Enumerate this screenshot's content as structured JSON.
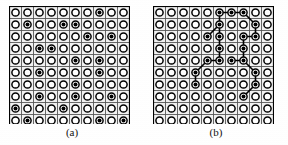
{
  "figure": {
    "type": "two-panel-lattice-diagram",
    "background_color": "#ffffff",
    "ink_color": "#000000",
    "gridline_color": "#555555",
    "cell_fill_color": "#f2f2f2",
    "grid_rows": 10,
    "grid_cols": 10,
    "cell_size_px": 12,
    "node_outer_radius_px": 3.6,
    "node_inner_radius_px": 2.0,
    "edge_width_px": 1.6
  },
  "panels": [
    {
      "id": "panel-a",
      "caption": "(a)",
      "description": "10 by 10 lattice of sites; filled (black) sites are randomly scattered occupied sites with no connecting bonds drawn.",
      "has_edges": false,
      "filled_count": 21,
      "filled_nodes": [
        {
          "row": 1,
          "col": 8
        },
        {
          "row": 2,
          "col": 2
        },
        {
          "row": 2,
          "col": 5
        },
        {
          "row": 2,
          "col": 6
        },
        {
          "row": 3,
          "col": 7
        },
        {
          "row": 3,
          "col": 9
        },
        {
          "row": 4,
          "col": 3
        },
        {
          "row": 4,
          "col": 4
        },
        {
          "row": 5,
          "col": 6
        },
        {
          "row": 5,
          "col": 8
        },
        {
          "row": 6,
          "col": 3
        },
        {
          "row": 6,
          "col": 8
        },
        {
          "row": 7,
          "col": 6
        },
        {
          "row": 8,
          "col": 3
        },
        {
          "row": 8,
          "col": 6
        },
        {
          "row": 8,
          "col": 9
        },
        {
          "row": 9,
          "col": 1
        },
        {
          "row": 9,
          "col": 5
        },
        {
          "row": 10,
          "col": 2
        },
        {
          "row": 10,
          "col": 8
        },
        {
          "row": 10,
          "col": 10
        }
      ],
      "edges": []
    },
    {
      "id": "panel-b",
      "caption": "(b)",
      "description": "Same 10 by 10 lattice; filled sites form a connected cluster joined by straight bond segments spanning the upper portion of the lattice.",
      "has_edges": true,
      "filled_count": 20,
      "filled_nodes": [
        {
          "row": 1,
          "col": 6
        },
        {
          "row": 1,
          "col": 7
        },
        {
          "row": 1,
          "col": 8
        },
        {
          "row": 2,
          "col": 6
        },
        {
          "row": 2,
          "col": 9
        },
        {
          "row": 3,
          "col": 5
        },
        {
          "row": 3,
          "col": 6
        },
        {
          "row": 3,
          "col": 8
        },
        {
          "row": 3,
          "col": 9
        },
        {
          "row": 4,
          "col": 6
        },
        {
          "row": 4,
          "col": 8
        },
        {
          "row": 5,
          "col": 5
        },
        {
          "row": 5,
          "col": 6
        },
        {
          "row": 5,
          "col": 7
        },
        {
          "row": 5,
          "col": 8
        },
        {
          "row": 6,
          "col": 4
        },
        {
          "row": 6,
          "col": 9
        },
        {
          "row": 7,
          "col": 4
        },
        {
          "row": 7,
          "col": 9
        },
        {
          "row": 8,
          "col": 8
        }
      ],
      "edges": [
        {
          "from": {
            "row": 1,
            "col": 6
          },
          "to": {
            "row": 1,
            "col": 7
          }
        },
        {
          "from": {
            "row": 1,
            "col": 7
          },
          "to": {
            "row": 1,
            "col": 8
          }
        },
        {
          "from": {
            "row": 1,
            "col": 6
          },
          "to": {
            "row": 2,
            "col": 6
          }
        },
        {
          "from": {
            "row": 1,
            "col": 8
          },
          "to": {
            "row": 2,
            "col": 9
          }
        },
        {
          "from": {
            "row": 2,
            "col": 6
          },
          "to": {
            "row": 3,
            "col": 5
          }
        },
        {
          "from": {
            "row": 2,
            "col": 6
          },
          "to": {
            "row": 3,
            "col": 6
          }
        },
        {
          "from": {
            "row": 2,
            "col": 9
          },
          "to": {
            "row": 3,
            "col": 9
          }
        },
        {
          "from": {
            "row": 3,
            "col": 8
          },
          "to": {
            "row": 3,
            "col": 9
          }
        },
        {
          "from": {
            "row": 3,
            "col": 6
          },
          "to": {
            "row": 4,
            "col": 6
          }
        },
        {
          "from": {
            "row": 3,
            "col": 8
          },
          "to": {
            "row": 4,
            "col": 8
          }
        },
        {
          "from": {
            "row": 4,
            "col": 6
          },
          "to": {
            "row": 5,
            "col": 6
          }
        },
        {
          "from": {
            "row": 4,
            "col": 8
          },
          "to": {
            "row": 5,
            "col": 8
          }
        },
        {
          "from": {
            "row": 5,
            "col": 5
          },
          "to": {
            "row": 5,
            "col": 6
          }
        },
        {
          "from": {
            "row": 5,
            "col": 7
          },
          "to": {
            "row": 5,
            "col": 8
          }
        },
        {
          "from": {
            "row": 5,
            "col": 5
          },
          "to": {
            "row": 6,
            "col": 4
          }
        },
        {
          "from": {
            "row": 5,
            "col": 8
          },
          "to": {
            "row": 6,
            "col": 9
          }
        },
        {
          "from": {
            "row": 6,
            "col": 4
          },
          "to": {
            "row": 7,
            "col": 4
          }
        },
        {
          "from": {
            "row": 6,
            "col": 9
          },
          "to": {
            "row": 7,
            "col": 9
          }
        },
        {
          "from": {
            "row": 7,
            "col": 9
          },
          "to": {
            "row": 8,
            "col": 8
          }
        }
      ]
    }
  ]
}
